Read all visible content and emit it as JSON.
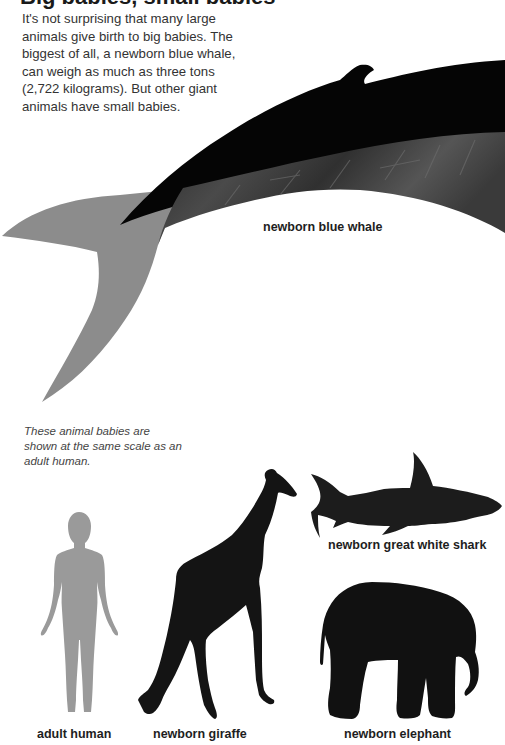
{
  "article": {
    "heading_partial": "Big babies, small babies",
    "intro": "It's not surprising that many large animals give birth to big babies. The biggest of all, a newborn blue whale, can weigh as much as three tons (2,722 kilograms). But other giant animals have small babies.",
    "caption": "These animal babies are shown at the same scale as an adult human."
  },
  "figures": {
    "whale": {
      "label": "newborn blue whale",
      "body_color": "#050505",
      "belly_color": "#3a3a3a",
      "tail_color": "#8c8c8c"
    },
    "shark": {
      "label": "newborn great white shark",
      "color": "#1c1c1c"
    },
    "human": {
      "label": "adult human",
      "color": "#9a9a9a"
    },
    "giraffe": {
      "label": "newborn giraffe",
      "color": "#141414"
    },
    "elephant": {
      "label": "newborn elephant",
      "color": "#111111"
    }
  }
}
